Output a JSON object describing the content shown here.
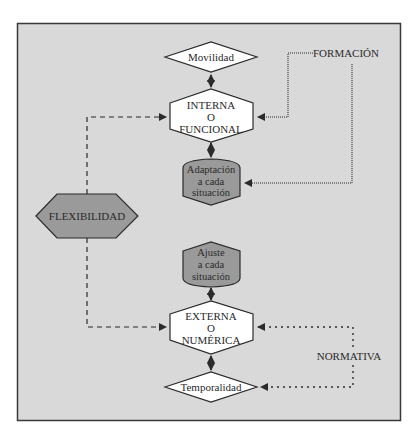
{
  "diagram": {
    "central": {
      "label": "FLEXIBILIDAD"
    },
    "internal": {
      "label_lines": [
        "INTERNA",
        "O",
        "FUNCIONAL"
      ],
      "top": {
        "label": "Movilidad"
      },
      "bottom": {
        "label_lines": [
          "Adaptación",
          "a cada",
          "situación"
        ]
      },
      "driver": {
        "label": "FORMACIÓN"
      }
    },
    "external": {
      "label_lines": [
        "EXTERNA",
        "O",
        "NUMÉRICA"
      ],
      "top": {
        "label_lines": [
          "Ajuste",
          "a cada",
          "situación"
        ]
      },
      "bottom": {
        "label": "Temporalidad"
      },
      "driver": {
        "label": "NORMATIVA"
      }
    }
  },
  "colors": {
    "frame_fill": "#d9d9d9",
    "frame_border": "#3a3a3a",
    "white_shape": "#ffffff",
    "gray_shape": "#9a9a9a",
    "stroke": "#2b2b2b"
  }
}
